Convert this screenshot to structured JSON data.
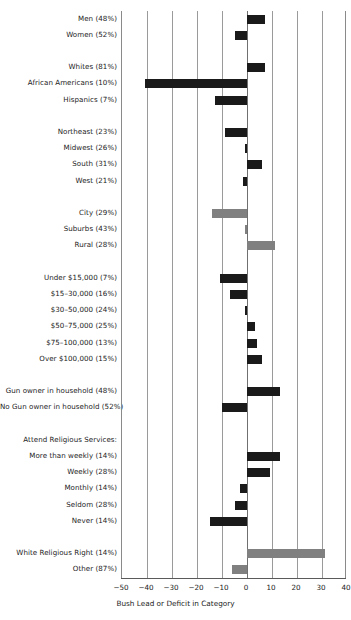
{
  "chart_data": {
    "type": "bar",
    "orientation": "horizontal",
    "title": "",
    "xlabel": "Bush Lead or Deficit in Category",
    "ylabel": "",
    "xlim": [
      -50,
      40
    ],
    "xticks": [
      -50,
      -40,
      -30,
      -20,
      -10,
      0,
      10,
      20,
      30,
      40
    ],
    "xtick_labels": [
      "−50",
      "−40",
      "−30",
      "−20",
      "−10",
      "0",
      "10",
      "20",
      "30",
      "40"
    ],
    "grid": true,
    "legend": "none",
    "colors": {
      "dark_bar": "#1a1a1a",
      "gray_bar": "#808080",
      "gridline": "#9a9a9a",
      "axis": "#5a5a5a"
    },
    "rows": [
      {
        "label": "Men (48%)",
        "value": 7,
        "color": "dark",
        "type": "bar"
      },
      {
        "label": "Women (52%)",
        "value": -5,
        "color": "dark",
        "type": "bar"
      },
      {
        "label": "",
        "value": null,
        "color": "none",
        "type": "spacer"
      },
      {
        "label": "Whites (81%)",
        "value": 7,
        "color": "dark",
        "type": "bar"
      },
      {
        "label": "African Americans (10%)",
        "value": -41,
        "color": "dark",
        "type": "bar"
      },
      {
        "label": "Hispanics (7%)",
        "value": -13,
        "color": "dark",
        "type": "bar"
      },
      {
        "label": "",
        "value": null,
        "color": "none",
        "type": "spacer"
      },
      {
        "label": "Northeast (23%)",
        "value": -9,
        "color": "dark",
        "type": "bar"
      },
      {
        "label": "Midwest (26%)",
        "value": -1,
        "color": "dark",
        "type": "bar"
      },
      {
        "label": "South (31%)",
        "value": 6,
        "color": "dark",
        "type": "bar"
      },
      {
        "label": "West (21%)",
        "value": -1.5,
        "color": "dark",
        "type": "bar"
      },
      {
        "label": "",
        "value": null,
        "color": "none",
        "type": "spacer"
      },
      {
        "label": "City (29%)",
        "value": -14,
        "color": "gray",
        "type": "bar"
      },
      {
        "label": "Suburbs (43%)",
        "value": -1,
        "color": "gray",
        "type": "bar"
      },
      {
        "label": "Rural (28%)",
        "value": 11,
        "color": "gray",
        "type": "bar"
      },
      {
        "label": "",
        "value": null,
        "color": "none",
        "type": "spacer"
      },
      {
        "label": "Under $15,000 (7%)",
        "value": -11,
        "color": "dark",
        "type": "bar"
      },
      {
        "label": "$15–30,000 (16%)",
        "value": -7,
        "color": "dark",
        "type": "bar"
      },
      {
        "label": "$30–50,000 (24%)",
        "value": -1,
        "color": "dark",
        "type": "bar"
      },
      {
        "label": "$50–75,000 (25%)",
        "value": 3,
        "color": "dark",
        "type": "bar"
      },
      {
        "label": "$75–100,000 (13%)",
        "value": 4,
        "color": "dark",
        "type": "bar"
      },
      {
        "label": "Over $100,000 (15%)",
        "value": 6,
        "color": "dark",
        "type": "bar"
      },
      {
        "label": "",
        "value": null,
        "color": "none",
        "type": "spacer"
      },
      {
        "label": "Gun owner in household (48%)",
        "value": 13,
        "color": "dark",
        "type": "bar"
      },
      {
        "label": "No Gun owner in household (52%)",
        "value": -10,
        "color": "dark",
        "type": "bar"
      },
      {
        "label": "",
        "value": null,
        "color": "none",
        "type": "spacer"
      },
      {
        "label": "Attend Religious Services:",
        "value": null,
        "color": "none",
        "type": "heading"
      },
      {
        "label": "More than weekly (14%)",
        "value": 13,
        "color": "dark",
        "type": "bar"
      },
      {
        "label": "Weekly (28%)",
        "value": 9,
        "color": "dark",
        "type": "bar"
      },
      {
        "label": "Monthly (14%)",
        "value": -3,
        "color": "dark",
        "type": "bar"
      },
      {
        "label": "Seldom (28%)",
        "value": -5,
        "color": "dark",
        "type": "bar"
      },
      {
        "label": "Never (14%)",
        "value": -15,
        "color": "dark",
        "type": "bar"
      },
      {
        "label": "",
        "value": null,
        "color": "none",
        "type": "spacer"
      },
      {
        "label": "White Religious Right (14%)",
        "value": 31,
        "color": "gray",
        "type": "bar"
      },
      {
        "label": "Other (87%)",
        "value": -6,
        "color": "gray",
        "type": "bar"
      }
    ]
  }
}
